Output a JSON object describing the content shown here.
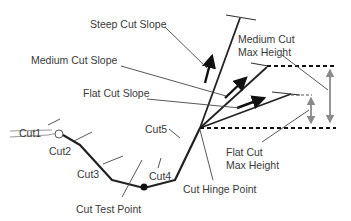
{
  "diagram": {
    "labels": {
      "steep_cut_slope": "Steep Cut Slope",
      "medium_cut_slope": "Medium Cut Slope",
      "flat_cut_slope": "Flat Cut Slope",
      "medium_cut_max_height_line1": "Medium Cut",
      "medium_cut_max_height_line2": "Max Height",
      "flat_cut_max_height_line1": "Flat Cut",
      "flat_cut_max_height_line2": "Max Height",
      "cut1": "Cut1",
      "cut2": "Cut2",
      "cut3": "Cut3",
      "cut4": "Cut4",
      "cut5": "Cut5",
      "cut_test_point": "Cut Test Point",
      "cut_hinge_point": "Cut Hinge Point"
    },
    "colors": {
      "line": "#222222",
      "leader": "#444444",
      "dimension": "#8a8a8a",
      "text": "#3a3a3a",
      "background": "#ffffff"
    }
  }
}
